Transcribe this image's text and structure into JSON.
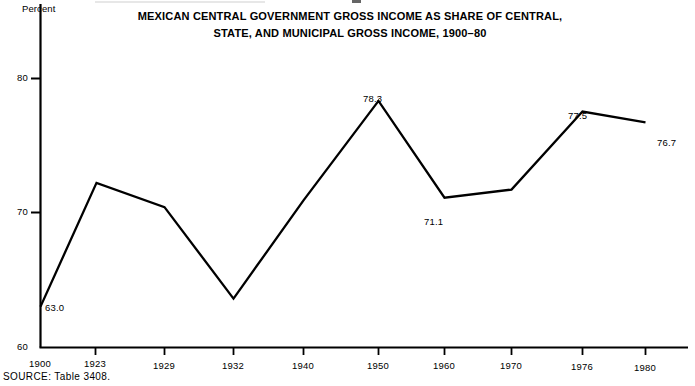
{
  "chart_data": {
    "type": "line",
    "title_lines": [
      "MEXICAN CENTRAL GOVERNMENT GROSS INCOME AS SHARE OF CENTRAL,",
      "STATE, AND MUNICIPAL GROSS INCOME, 1900–80"
    ],
    "xlabel": "",
    "ylabel": "Percent",
    "ylim": [
      60,
      84
    ],
    "grid": false,
    "legend": "none",
    "yticks": [
      60,
      70,
      80
    ],
    "ytick_labels": [
      "60",
      "70",
      "80"
    ],
    "categories": [
      "1900",
      "1923",
      "1929",
      "1932",
      "1940",
      "1950",
      "1960",
      "1970",
      "1976",
      "1980"
    ],
    "x": [
      1900,
      1923,
      1929,
      1932,
      1940,
      1950,
      1960,
      1970,
      1976,
      1980
    ],
    "values": [
      63.0,
      72.2,
      70.4,
      63.6,
      70.9,
      78.3,
      71.1,
      71.7,
      77.5,
      76.7
    ],
    "point_labels": [
      "63.0",
      "",
      "",
      "",
      "",
      "78.3",
      "71.1",
      "",
      "77.5",
      "76.7"
    ],
    "annotations": [
      {
        "text": "63.0",
        "value": 63.0,
        "category": "1900",
        "position": "right"
      },
      {
        "text": "78.3",
        "value": 78.3,
        "category": "1950",
        "position": "above"
      },
      {
        "text": "71.1",
        "value": 71.1,
        "category": "1960",
        "position": "below"
      },
      {
        "text": "77.5",
        "value": 77.5,
        "category": "1976",
        "position": "above"
      },
      {
        "text": "76.7",
        "value": 76.7,
        "category": "1980",
        "position": "right"
      }
    ],
    "line_color": "#000000",
    "axis_color": "#000000",
    "background_color": "#ffffff"
  },
  "axis": {
    "unit_label": "Percent",
    "ytick_0": "60",
    "ytick_1": "70",
    "ytick_2": "80",
    "xtick_0": "1900",
    "xtick_1": "1923",
    "xtick_2": "1929",
    "xtick_3": "1932",
    "xtick_4": "1940",
    "xtick_5": "1950",
    "xtick_6": "1960",
    "xtick_7": "1970",
    "xtick_8": "1976",
    "xtick_9": "1980"
  },
  "title": {
    "line1": "MEXICAN CENTRAL GOVERNMENT GROSS INCOME AS SHARE OF CENTRAL,",
    "line2": "STATE, AND MUNICIPAL GROSS INCOME, 1900–80"
  },
  "labels": {
    "v1900": "63.0",
    "v1950": "78.3",
    "v1960": "71.1",
    "v1976": "77.5",
    "v1980": "76.7"
  },
  "footer": {
    "source": "SOURCE: Table 3408."
  }
}
